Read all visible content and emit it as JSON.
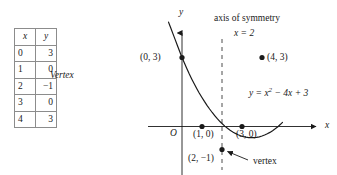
{
  "table": {
    "headers": [
      "x",
      "y"
    ],
    "rows": [
      {
        "x": "0",
        "y": "3"
      },
      {
        "x": "1",
        "y": "0"
      },
      {
        "x": "2",
        "y": "−1"
      },
      {
        "x": "3",
        "y": "0"
      },
      {
        "x": "4",
        "y": "3"
      }
    ],
    "annotation": "Vertex",
    "annotation_row_index": 2
  },
  "graph": {
    "y_axis_label": "y",
    "x_axis_label": "x",
    "origin_label": "O",
    "axis_of_symmetry_label": "axis of symmetry",
    "axis_of_symmetry_equation": "x = 2",
    "equation_label": "y = x² − 4x + 3",
    "vertex_callout": "vertex",
    "point_labels": {
      "p0": "(0, 3)",
      "p1": "(1, 0)",
      "p2": "(2, −1)",
      "p3": "(3, 0)",
      "p4": "(4, 3)"
    }
  },
  "chart_data": {
    "type": "line",
    "title": "",
    "xlabel": "x",
    "ylabel": "y",
    "function": "y = x^2 - 4x + 3",
    "grid": false,
    "legend": null,
    "xlim": [
      -1.7,
      6.9
    ],
    "ylim": [
      -2.1,
      4.2
    ],
    "axis_of_symmetry": 2,
    "vertex": [
      2,
      -1
    ],
    "roots": [
      1,
      3
    ],
    "points": [
      {
        "x": 0,
        "y": 3,
        "label": "(0, 3)"
      },
      {
        "x": 1,
        "y": 0,
        "label": "(1, 0)"
      },
      {
        "x": 2,
        "y": -1,
        "label": "(2, −1)"
      },
      {
        "x": 3,
        "y": 0,
        "label": "(3, 0)"
      },
      {
        "x": 4,
        "y": 3,
        "label": "(4, 3)"
      }
    ],
    "annotations": [
      {
        "text": "axis of symmetry",
        "x": 3.3,
        "y": 3.9
      },
      {
        "text": "x = 2",
        "x": 3.0,
        "y": 3.3
      },
      {
        "text": "y = x^2 - 4x + 3",
        "x": 4.6,
        "y": 1.3
      },
      {
        "text": "vertex",
        "x": 3.6,
        "y": -1.75
      }
    ]
  }
}
